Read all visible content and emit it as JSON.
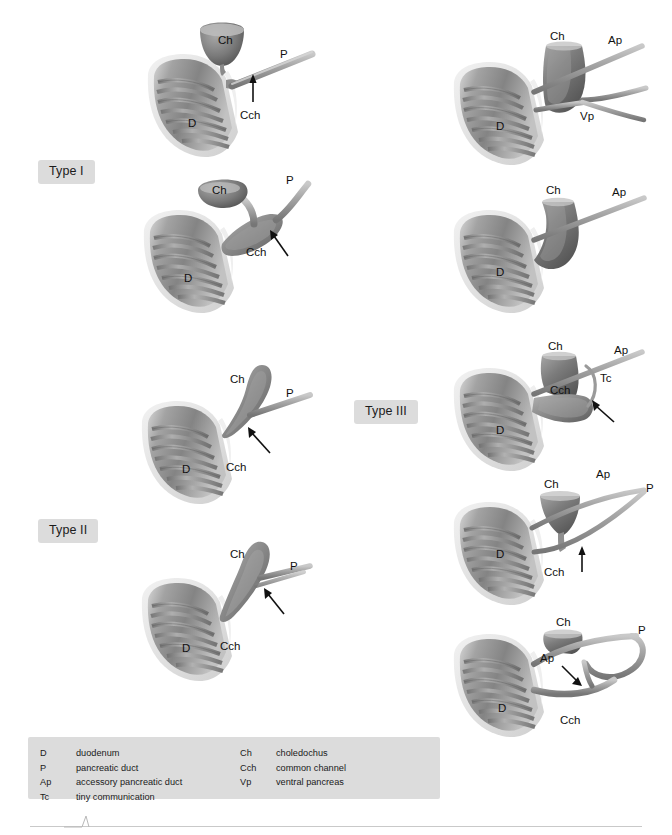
{
  "figure": {
    "background_color": "#ffffff",
    "badge_color": "#dcdcdc",
    "label_color": "#111111",
    "tissue_color": "#9a9a9a"
  },
  "types": [
    {
      "id": "type-1",
      "label": "Type I"
    },
    {
      "id": "type-2",
      "label": "Type II"
    },
    {
      "id": "type-3",
      "label": "Type III"
    }
  ],
  "panels": [
    {
      "id": "type1-a",
      "group": "Type I",
      "labels": [
        {
          "text": "Ch",
          "x": 78,
          "y": 22
        },
        {
          "text": "P",
          "x": 140,
          "y": 36
        },
        {
          "text": "Cch",
          "x": 110,
          "y": 95
        },
        {
          "text": "D",
          "x": 48,
          "y": 105
        }
      ],
      "arrow": "up"
    },
    {
      "id": "type1-b",
      "group": "Type I",
      "labels": [
        {
          "text": "Ch",
          "x": 78,
          "y": 20
        },
        {
          "text": "P",
          "x": 148,
          "y": 12
        },
        {
          "text": "Cch",
          "x": 112,
          "y": 78
        },
        {
          "text": "D",
          "x": 48,
          "y": 108
        }
      ],
      "arrow": "up-right"
    },
    {
      "id": "type2-a",
      "group": "Type II",
      "labels": [
        {
          "text": "Ch",
          "x": 92,
          "y": 22
        },
        {
          "text": "P",
          "x": 152,
          "y": 44
        },
        {
          "text": "Cch",
          "x": 95,
          "y": 100
        },
        {
          "text": "D",
          "x": 48,
          "y": 118
        }
      ],
      "arrow": "up-right"
    },
    {
      "id": "type2-b",
      "group": "Type II",
      "labels": [
        {
          "text": "Ch",
          "x": 92,
          "y": 22
        },
        {
          "text": "P",
          "x": 150,
          "y": 42
        },
        {
          "text": "Cch",
          "x": 88,
          "y": 100
        },
        {
          "text": "D",
          "x": 48,
          "y": 122
        }
      ],
      "arrow": "up-right"
    },
    {
      "id": "type3-a",
      "group": "Type III",
      "labels": [
        {
          "text": "Ch",
          "x": 108,
          "y": 16
        },
        {
          "text": "Ap",
          "x": 160,
          "y": 20
        },
        {
          "text": "Vp",
          "x": 135,
          "y": 92
        },
        {
          "text": "D",
          "x": 50,
          "y": 104
        }
      ],
      "arrow": "none"
    },
    {
      "id": "type3-b",
      "group": "Type III",
      "labels": [
        {
          "text": "Ch",
          "x": 104,
          "y": 18
        },
        {
          "text": "Ap",
          "x": 164,
          "y": 20
        },
        {
          "text": "D",
          "x": 50,
          "y": 98
        }
      ],
      "arrow": "none"
    },
    {
      "id": "type3-c",
      "group": "Type III",
      "labels": [
        {
          "text": "Ch",
          "x": 104,
          "y": 14
        },
        {
          "text": "Ap",
          "x": 166,
          "y": 18
        },
        {
          "text": "Tc",
          "x": 152,
          "y": 44
        },
        {
          "text": "Cch",
          "x": 108,
          "y": 56
        },
        {
          "text": "D",
          "x": 50,
          "y": 96
        }
      ],
      "arrow": "up-right"
    },
    {
      "id": "type3-d",
      "group": "Type III",
      "labels": [
        {
          "text": "Ch",
          "x": 100,
          "y": 22
        },
        {
          "text": "Ap",
          "x": 148,
          "y": 12
        },
        {
          "text": "P",
          "x": 196,
          "y": 26
        },
        {
          "text": "Cch",
          "x": 100,
          "y": 92
        },
        {
          "text": "D",
          "x": 50,
          "y": 90
        }
      ],
      "arrow": "up"
    },
    {
      "id": "type3-e",
      "group": "Type III",
      "labels": [
        {
          "text": "Ch",
          "x": 112,
          "y": 20
        },
        {
          "text": "P",
          "x": 190,
          "y": 28
        },
        {
          "text": "Ap",
          "x": 96,
          "y": 54
        },
        {
          "text": "Cch",
          "x": 118,
          "y": 118
        },
        {
          "text": "D",
          "x": 52,
          "y": 110
        }
      ],
      "arrow": "down-right"
    }
  ],
  "legend": {
    "left_column": [
      {
        "abbr": "D",
        "term": "duodenum"
      },
      {
        "abbr": "P",
        "term": "pancreatic duct"
      },
      {
        "abbr": "Ap",
        "term": "accessory pancreatic duct"
      },
      {
        "abbr": "Tc",
        "term": "tiny communication"
      }
    ],
    "right_column": [
      {
        "abbr": "Ch",
        "term": "choledochus"
      },
      {
        "abbr": "Cch",
        "term": "common channel"
      },
      {
        "abbr": "Vp",
        "term": "ventral pancreas"
      }
    ]
  }
}
